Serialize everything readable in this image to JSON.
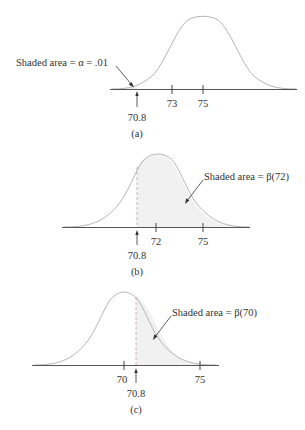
{
  "figure": {
    "panels": [
      {
        "id": "a",
        "caption": "(a)",
        "annotation": "Shaded area = α = .01",
        "mean": 75,
        "critical_value": 70.8,
        "critical_label": "70.8",
        "ticks": [
          {
            "value": 73,
            "label": "73"
          },
          {
            "value": 75,
            "label": "75"
          }
        ],
        "shaded_region": "left tail below 70.8"
      },
      {
        "id": "b",
        "caption": "(b)",
        "annotation": "Shaded area = β(72)",
        "mean": 72,
        "critical_value": 70.8,
        "critical_label": "70.8",
        "ticks": [
          {
            "value": 72,
            "label": "72"
          },
          {
            "value": 75,
            "label": "75"
          }
        ],
        "shaded_region": "right of 70.8"
      },
      {
        "id": "c",
        "caption": "(c)",
        "annotation": "Shaded area = β(70)",
        "mean": 70,
        "critical_value": 70.8,
        "critical_label": "70.8",
        "ticks": [
          {
            "value": 70,
            "label": "70"
          },
          {
            "value": 75,
            "label": "75"
          }
        ],
        "shaded_region": "right of 70.8"
      }
    ],
    "colors": {
      "curve": "#b5b5b5",
      "axis": "#555555",
      "shading": "#f1f1f1",
      "text": "#333333"
    }
  }
}
